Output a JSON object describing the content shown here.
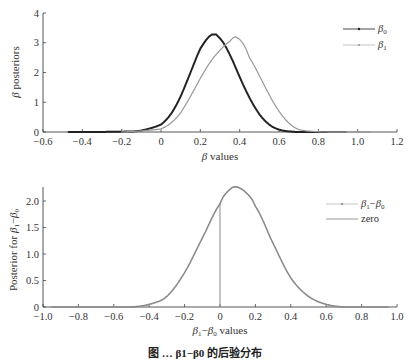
{
  "chart_data": [
    {
      "type": "line",
      "title": "",
      "xlabel": "β values",
      "ylabel": "β posteriors",
      "xlim": [
        -0.6,
        1.2
      ],
      "ylim": [
        0,
        4
      ],
      "xticks": [
        "-0.6",
        "-0.4",
        "-0.2",
        "0",
        "0.2",
        "0.4",
        "0.6",
        "0.8",
        "1.0",
        "1.2"
      ],
      "yticks": [
        "0",
        "1",
        "2",
        "3",
        "4"
      ],
      "grid": false,
      "legend_position": "upper right",
      "series": [
        {
          "name": "β0",
          "color": "#222222",
          "marker": "dot",
          "x": [
            -0.47,
            -0.2,
            -0.1,
            0.0,
            0.05,
            0.1,
            0.15,
            0.2,
            0.26,
            0.3,
            0.35,
            0.4,
            0.45,
            0.5,
            0.55,
            0.6,
            0.65,
            0.7,
            0.8,
            0.94
          ],
          "y": [
            0.0,
            0.01,
            0.05,
            0.25,
            0.6,
            1.2,
            2.0,
            2.8,
            3.28,
            3.15,
            2.6,
            1.85,
            1.15,
            0.6,
            0.25,
            0.08,
            0.02,
            0.0,
            0.0,
            0.0
          ]
        },
        {
          "name": "β1",
          "color": "#9a9a9a",
          "marker": "dot",
          "x": [
            -0.2,
            0.0,
            0.05,
            0.1,
            0.15,
            0.2,
            0.25,
            0.3,
            0.35,
            0.38,
            0.42,
            0.45,
            0.5,
            0.55,
            0.6,
            0.65,
            0.7,
            0.8,
            0.9,
            1.07
          ],
          "y": [
            0.0,
            0.1,
            0.3,
            0.65,
            1.2,
            1.8,
            2.35,
            2.75,
            3.05,
            3.2,
            2.95,
            2.5,
            1.9,
            1.25,
            0.7,
            0.3,
            0.08,
            0.01,
            0.0,
            0.0
          ]
        }
      ]
    },
    {
      "type": "line",
      "title": "",
      "xlabel": "β1−β0 values",
      "ylabel": "Posterior for β1−β0",
      "xlim": [
        -1.0,
        1.0
      ],
      "ylim": [
        0,
        2.25
      ],
      "xticks": [
        "-1.0",
        "-0.8",
        "-0.6",
        "-0.4",
        "-0.2",
        "0",
        "0.2",
        "0.4",
        "0.6",
        "0.8",
        "1.0"
      ],
      "yticks": [
        "0",
        "0.5",
        "1.0",
        "1.5",
        "2.0"
      ],
      "grid": false,
      "legend_position": "upper right",
      "series": [
        {
          "name": "β1−β0",
          "color": "#8a8a8a",
          "marker": "dot",
          "x": [
            -0.95,
            -0.5,
            -0.4,
            -0.3,
            -0.2,
            -0.1,
            0.0,
            0.05,
            0.09,
            0.15,
            0.2,
            0.3,
            0.4,
            0.5,
            0.6,
            0.7,
            0.95
          ],
          "y": [
            0.0,
            0.0,
            0.05,
            0.2,
            0.65,
            1.3,
            1.95,
            2.2,
            2.27,
            2.15,
            1.9,
            1.2,
            0.55,
            0.2,
            0.05,
            0.0,
            0.0
          ]
        },
        {
          "name": "zero",
          "color": "#8a8a8a",
          "marker": "none",
          "x": [
            0,
            0
          ],
          "y": [
            0,
            1.95
          ]
        }
      ]
    }
  ],
  "top_chart": {
    "ylabel_prefix": "β",
    "ylabel_rest": " posteriors",
    "xlabel_prefix": "β",
    "xlabel_rest": " values",
    "legend": [
      {
        "sym": "β",
        "sub": "0"
      },
      {
        "sym": "β",
        "sub": "1"
      }
    ]
  },
  "bottom_chart": {
    "ylabel_rest": "Posterior for ",
    "xlabel_rest": " values",
    "legend_zero": "zero",
    "diff_sym_a": "β",
    "diff_sub_a": "1",
    "diff_minus": "−",
    "diff_sym_b": "β",
    "diff_sub_b": "0"
  },
  "caption": "图 … β1−β0 的后验分布"
}
